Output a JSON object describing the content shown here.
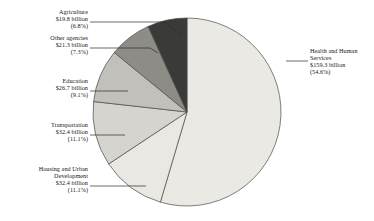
{
  "chart_data": {
    "type": "pie",
    "title": "",
    "subtitle": "",
    "xlabel": "",
    "ylabel": "",
    "legend_position": "none",
    "grid": false,
    "units": "billions of dollars",
    "start_angle_deg": 0,
    "direction": "clockwise",
    "total_value": 291.9,
    "total_label": "$291.9 billion",
    "categories": [
      "Health and Human Services",
      "Housing and Urban Development",
      "Transportation",
      "Education",
      "Other agencies",
      "Agriculture"
    ],
    "values": [
      159.3,
      32.4,
      32.4,
      26.7,
      21.3,
      19.8
    ],
    "percentages": [
      54.6,
      11.1,
      11.1,
      9.1,
      7.3,
      6.8
    ],
    "value_labels": [
      "$159.3 billion",
      "$32.4 billion",
      "$32.4 billion",
      "$26.7 billion",
      "$21.3 billion",
      "$19.8 billion"
    ],
    "percent_labels": [
      "(54.6%)",
      "(11.1%)",
      "(11.1%)",
      "(9.1%)",
      "(7.3%)",
      "(6.8%)"
    ],
    "colors": [
      "#ebe9e4",
      "#eae8e3",
      "#d6d4cf",
      "#c2c0bb",
      "#8e8c87",
      "#3a3a38"
    ],
    "slice_outline_color": "#4a4a48"
  },
  "slices": [
    {
      "id": "health-and-human-services",
      "name_lines": [
        "Health and Human",
        "Services"
      ],
      "value_label": "$159.3 billion",
      "percent_label": "(54.6%)",
      "value": 159.3,
      "percent": 54.6,
      "color": "#ebe9e4"
    },
    {
      "id": "housing-and-urban-development",
      "name_lines": [
        "Housing and Urban",
        "Development"
      ],
      "value_label": "$32.4 billion",
      "percent_label": "(11.1%)",
      "value": 32.4,
      "percent": 11.1,
      "color": "#eae8e3"
    },
    {
      "id": "transportation",
      "name_lines": [
        "Transportation"
      ],
      "value_label": "$32.4 billion",
      "percent_label": "(11.1%)",
      "value": 32.4,
      "percent": 11.1,
      "color": "#d6d4cf"
    },
    {
      "id": "education",
      "name_lines": [
        "Education"
      ],
      "value_label": "$26.7 billion",
      "percent_label": "(9.1%)",
      "value": 26.7,
      "percent": 9.1,
      "color": "#c2c0bb"
    },
    {
      "id": "other-agencies",
      "name_lines": [
        "Other agencies"
      ],
      "value_label": "$21.3 billion",
      "percent_label": "(7.3%)",
      "value": 21.3,
      "percent": 7.3,
      "color": "#8e8c87"
    },
    {
      "id": "agriculture",
      "name_lines": [
        "Agriculture"
      ],
      "value_label": "$19.8 billion",
      "percent_label": "(6.8%)",
      "value": 19.8,
      "percent": 6.8,
      "color": "#3a3a38"
    }
  ],
  "labels": {
    "agriculture": {
      "l1": "Agriculture",
      "l2": "$19.8 billion",
      "l3": "(6.8%)"
    },
    "other_agencies": {
      "l1": "Other agencies",
      "l2": "$21.3 billion",
      "l3": "(7.3%)"
    },
    "education": {
      "l1": "Education",
      "l2": "$26.7 billion",
      "l3": "(9.1%)"
    },
    "transportation": {
      "l1": "Transportation",
      "l2": "$32.4 billion",
      "l3": "(11.1%)"
    },
    "housing": {
      "l1": "Housing and Urban",
      "l2": "Development",
      "l3": "$32.4 billion",
      "l4": "(11.1%)"
    },
    "hhs": {
      "l1": "Health and Human",
      "l2": "Services",
      "l3": "$159.3 billion",
      "l4": "(54.6%)"
    }
  }
}
